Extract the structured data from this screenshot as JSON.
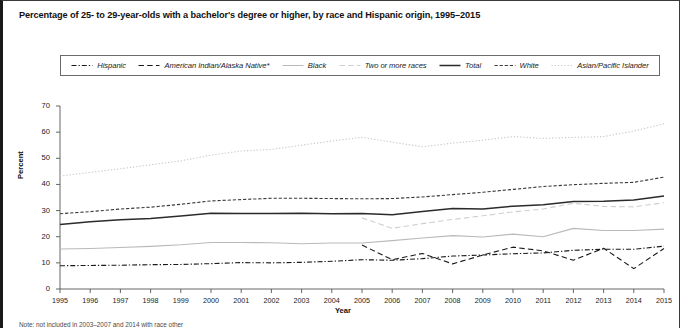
{
  "title": "Percentage of 25- to 29-year-olds with a bachelor's degree or higher, by race and Hispanic origin, 1995–2015",
  "footnote": "Note: not included in 2003–2007 and 2014 with race other",
  "axes": {
    "ylabel": "Percent",
    "xlabel": "Year",
    "yticks": [
      "0",
      "10",
      "20",
      "30",
      "40",
      "50",
      "60",
      "70"
    ],
    "ylim": [
      0,
      70
    ],
    "xticks": [
      "1995",
      "1996",
      "1997",
      "1998",
      "1999",
      "2000",
      "2001",
      "2002",
      "2003",
      "2004",
      "2005",
      "2006",
      "2007",
      "2008",
      "2009",
      "2010",
      "2011",
      "2012",
      "2013",
      "2014",
      "2015"
    ]
  },
  "legend": {
    "items": [
      {
        "label": "Hispanic",
        "style": "dashdot",
        "color": "#1a1a1a",
        "width": 1.1
      },
      {
        "label": "American Indian/Alaska Native*",
        "style": "longdash",
        "color": "#1a1a1a",
        "width": 1.1
      },
      {
        "label": "Black",
        "style": "solid",
        "color": "#b9b9b9",
        "width": 1.0
      },
      {
        "label": "Two or more races",
        "style": "longdash",
        "color": "#cfcfcf",
        "width": 1.1
      },
      {
        "label": "Total",
        "style": "solid",
        "color": "#2b2b2b",
        "width": 1.5
      },
      {
        "label": "White",
        "style": "dash",
        "color": "#3a3a3a",
        "width": 1.2
      },
      {
        "label": "Asian/Pacific Islander",
        "style": "dot",
        "color": "#c9c9c9",
        "width": 1.2
      }
    ]
  },
  "chart_data": {
    "type": "line",
    "title": "Percentage of 25- to 29-year-olds with a bachelor's degree or higher, by race and Hispanic origin, 1995–2015",
    "xlabel": "Year",
    "ylabel": "Percent",
    "ylim": [
      0,
      70
    ],
    "xlim": [
      1995,
      2015
    ],
    "grid": false,
    "legend_position": "top",
    "x": [
      1995,
      1996,
      1997,
      1998,
      1999,
      2000,
      2001,
      2002,
      2003,
      2004,
      2005,
      2006,
      2007,
      2008,
      2009,
      2010,
      2011,
      2012,
      2013,
      2014,
      2015
    ],
    "series": [
      {
        "name": "Asian/Pacific Islander",
        "style": "dot",
        "color": "#c9c9c9",
        "values": [
          43.2,
          44.6,
          46.0,
          47.5,
          49.0,
          51.2,
          52.8,
          53.4,
          55.0,
          56.6,
          58.0,
          56.2,
          54.4,
          55.8,
          56.9,
          58.3,
          57.6,
          58.0,
          58.3,
          60.4,
          63.2
        ]
      },
      {
        "name": "White",
        "style": "dash",
        "color": "#3a3a3a",
        "values": [
          28.8,
          29.6,
          30.6,
          31.3,
          32.4,
          33.7,
          34.2,
          34.7,
          34.7,
          34.6,
          34.5,
          34.6,
          35.2,
          36.1,
          37.0,
          38.1,
          39.2,
          39.9,
          40.4,
          40.8,
          42.8
        ]
      },
      {
        "name": "Total",
        "style": "solid",
        "color": "#2b2b2b",
        "values": [
          24.7,
          25.7,
          26.5,
          27.0,
          27.9,
          29.0,
          28.9,
          28.9,
          29.0,
          28.8,
          28.9,
          28.4,
          29.6,
          30.8,
          30.6,
          31.7,
          32.2,
          33.5,
          33.6,
          34.0,
          35.6
        ]
      },
      {
        "name": "Two or more races",
        "style": "longdash",
        "color": "#cfcfcf",
        "values": [
          null,
          null,
          null,
          null,
          null,
          null,
          null,
          null,
          null,
          null,
          27.2,
          23.2,
          25.0,
          26.6,
          28.0,
          29.5,
          30.6,
          32.8,
          31.6,
          31.4,
          33.0
        ]
      },
      {
        "name": "Black",
        "style": "solid",
        "color": "#b9b9b9",
        "values": [
          15.3,
          15.5,
          15.9,
          16.3,
          16.9,
          17.8,
          17.8,
          17.7,
          17.3,
          17.6,
          17.6,
          18.5,
          19.5,
          20.4,
          19.9,
          21.0,
          20.0,
          23.2,
          22.4,
          22.4,
          22.9
        ]
      },
      {
        "name": "American Indian/Alaska Native*",
        "style": "longdash",
        "color": "#1a1a1a",
        "values": [
          null,
          null,
          null,
          null,
          null,
          null,
          null,
          null,
          null,
          null,
          16.8,
          11.2,
          13.6,
          9.6,
          13.0,
          16.0,
          14.6,
          11.0,
          15.6,
          7.8,
          15.5
        ]
      },
      {
        "name": "Hispanic",
        "style": "dashdot",
        "color": "#1a1a1a",
        "values": [
          8.9,
          9.0,
          9.1,
          9.3,
          9.4,
          9.7,
          10.1,
          10.0,
          10.2,
          10.6,
          11.2,
          11.0,
          11.6,
          12.6,
          13.0,
          13.5,
          13.8,
          14.8,
          15.2,
          15.2,
          16.4
        ]
      }
    ]
  }
}
